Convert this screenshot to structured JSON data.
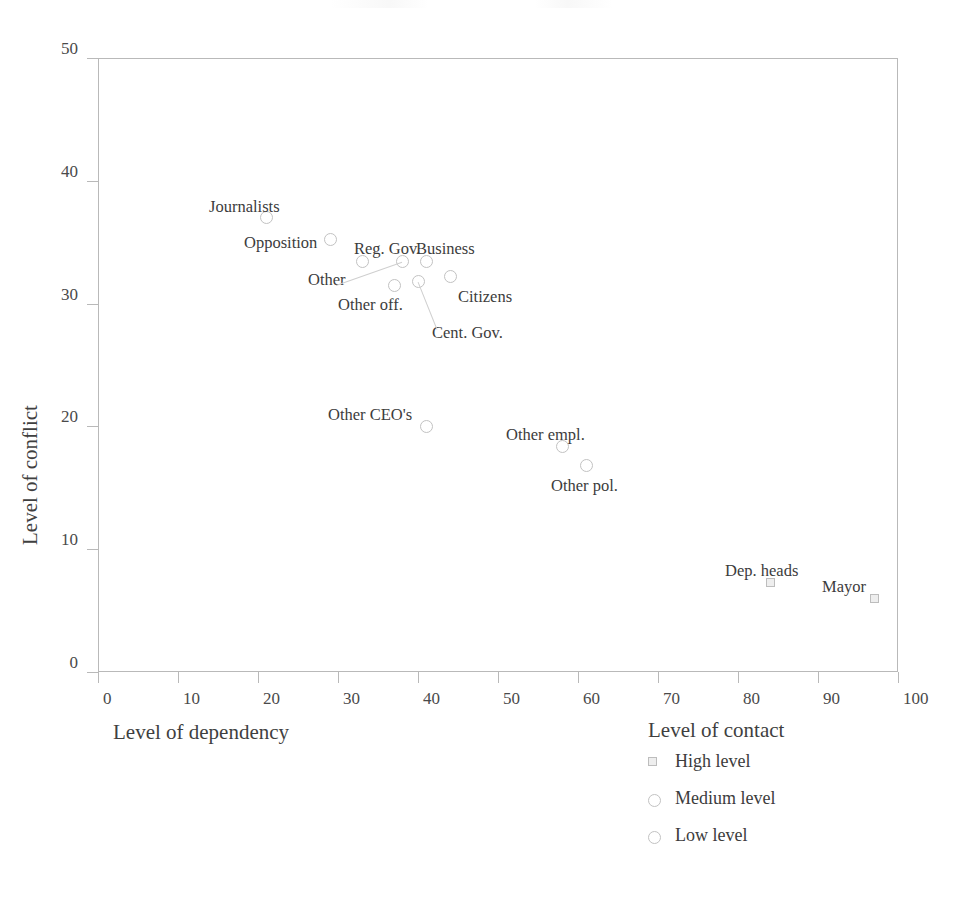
{
  "chart_data": {
    "type": "scatter",
    "title": "",
    "xlabel": "Level of dependency",
    "xlabel2": "Level of contact",
    "ylabel": "Level of conflict",
    "xlim": [
      0,
      100
    ],
    "ylim": [
      0,
      50
    ],
    "xticks": [
      0,
      10,
      20,
      30,
      40,
      50,
      60,
      70,
      80,
      90,
      100
    ],
    "yticks": [
      0,
      10,
      20,
      30,
      40,
      50
    ],
    "grid": false,
    "points": [
      {
        "label": "Journalists",
        "x": 21,
        "y": 37.0,
        "marker": "circle",
        "group": "Low level",
        "label_dx": -57,
        "label_dy": -19
      },
      {
        "label": "Opposition",
        "x": 29,
        "y": 35.2,
        "marker": "circle",
        "group": "Low level",
        "label_dx": -86,
        "label_dy": -5
      },
      {
        "label": "Reg. Gov.",
        "x": 33,
        "y": 33.4,
        "marker": "circle",
        "group": "Medium level",
        "label_dx": -8,
        "label_dy": -21
      },
      {
        "label": "Other",
        "x": 38,
        "y": 33.4,
        "marker": "circle",
        "group": "Medium level",
        "label_dx": -94,
        "label_dy": 10
      },
      {
        "label": "Business",
        "x": 41,
        "y": 33.4,
        "marker": "circle",
        "group": "Medium level",
        "label_dx": -10,
        "label_dy": -21
      },
      {
        "label": "Other off.",
        "x": 37,
        "y": 31.5,
        "marker": "circle",
        "group": "Medium level",
        "label_dx": -56,
        "label_dy": 12
      },
      {
        "label": "Cent. Gov.",
        "x": 40,
        "y": 31.8,
        "marker": "circle",
        "group": "Medium level",
        "label_dx": 14,
        "label_dy": 44
      },
      {
        "label": "Citizens",
        "x": 44,
        "y": 32.2,
        "marker": "circle",
        "group": "Medium level",
        "label_dx": 8,
        "label_dy": 12
      },
      {
        "label": "Other CEO's",
        "x": 41,
        "y": 20.0,
        "marker": "circle",
        "group": "Medium level",
        "label_dx": -98,
        "label_dy": -19
      },
      {
        "label": "Other empl.",
        "x": 58,
        "y": 18.4,
        "marker": "circle",
        "group": "Medium level",
        "label_dx": -56,
        "label_dy": -19
      },
      {
        "label": "Other pol.",
        "x": 61,
        "y": 16.8,
        "marker": "circle",
        "group": "Medium level",
        "label_dx": -35,
        "label_dy": 12
      },
      {
        "label": "Dep. heads",
        "x": 84,
        "y": 7.3,
        "marker": "square",
        "group": "High level",
        "label_dx": -45,
        "label_dy": -19
      },
      {
        "label": "Mayor",
        "x": 97,
        "y": 6.0,
        "marker": "square",
        "group": "High level",
        "label_dx": -52,
        "label_dy": -19
      }
    ],
    "leader_lines": [
      {
        "from": "Other",
        "to_x": 336,
        "to_y": 285
      },
      {
        "from": "Cent. Gov.",
        "to_x": 437,
        "to_y": 329
      }
    ],
    "legend": {
      "title": "Level of contact",
      "position": "below-right",
      "entries": [
        {
          "label": "High level",
          "marker": "square"
        },
        {
          "label": "Medium level",
          "marker": "circle"
        },
        {
          "label": "Low level",
          "marker": "circle"
        }
      ]
    },
    "colors": {
      "marker_stroke": "#c2c2c2",
      "square_fill": "#eeeeee",
      "axis": "#b9b9b9",
      "text": "#3c3c3c"
    }
  }
}
